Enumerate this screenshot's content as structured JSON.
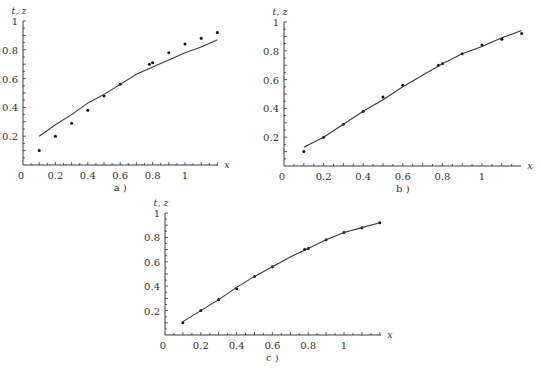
{
  "chart_data": [
    {
      "type": "line",
      "panel": "a",
      "caption": "a )",
      "xlabel": "x",
      "ylabel": "t, z",
      "xlim": [
        0,
        1.2
      ],
      "ylim": [
        0,
        1
      ],
      "xticks": [
        "0",
        "0.2",
        "0.4",
        "0.6",
        "0.8",
        "1"
      ],
      "yticks": [
        "0.2",
        "0.4",
        "0.6",
        "0.8",
        "1"
      ],
      "grid": false,
      "series": [
        {
          "name": "t (points)",
          "kind": "scatter",
          "x": [
            0.1,
            0.2,
            0.3,
            0.4,
            0.5,
            0.6,
            0.78,
            0.8,
            0.9,
            1.0,
            1.1,
            1.2
          ],
          "y": [
            0.1,
            0.2,
            0.29,
            0.38,
            0.48,
            0.56,
            0.7,
            0.71,
            0.78,
            0.84,
            0.88,
            0.92
          ]
        },
        {
          "name": "z (curve)",
          "kind": "line",
          "x": [
            0.1,
            0.2,
            0.3,
            0.4,
            0.5,
            0.6,
            0.7,
            0.8,
            0.9,
            1.0,
            1.1,
            1.2
          ],
          "y": [
            0.2,
            0.28,
            0.35,
            0.43,
            0.49,
            0.56,
            0.63,
            0.68,
            0.73,
            0.78,
            0.82,
            0.87
          ]
        }
      ]
    },
    {
      "type": "line",
      "panel": "b",
      "caption": "b )",
      "xlabel": "x",
      "ylabel": "t, z",
      "xlim": [
        0,
        1.2
      ],
      "ylim": [
        0,
        1
      ],
      "xticks": [
        "0",
        "0.2",
        "0.4",
        "0.6",
        "0.8",
        "1"
      ],
      "yticks": [
        "0.2",
        "0.4",
        "0.6",
        "0.8",
        "1"
      ],
      "grid": false,
      "series": [
        {
          "name": "t (points)",
          "kind": "scatter",
          "x": [
            0.1,
            0.2,
            0.3,
            0.4,
            0.5,
            0.6,
            0.78,
            0.8,
            0.9,
            1.0,
            1.1,
            1.2
          ],
          "y": [
            0.1,
            0.2,
            0.29,
            0.38,
            0.48,
            0.56,
            0.7,
            0.71,
            0.78,
            0.84,
            0.88,
            0.92
          ]
        },
        {
          "name": "z (curve)",
          "kind": "line",
          "x": [
            0.1,
            0.2,
            0.3,
            0.4,
            0.5,
            0.6,
            0.7,
            0.8,
            0.9,
            1.0,
            1.1,
            1.2
          ],
          "y": [
            0.13,
            0.2,
            0.29,
            0.38,
            0.46,
            0.55,
            0.63,
            0.71,
            0.78,
            0.83,
            0.89,
            0.94
          ]
        }
      ]
    },
    {
      "type": "line",
      "panel": "c",
      "caption": "c )",
      "xlabel": "x",
      "ylabel": "t, z",
      "xlim": [
        0,
        1.2
      ],
      "ylim": [
        0,
        1
      ],
      "xticks": [
        "0",
        "0.2",
        "0.4",
        "0.6",
        "0.8",
        "1"
      ],
      "yticks": [
        "0.2",
        "0.4",
        "0.6",
        "0.8",
        "1"
      ],
      "grid": false,
      "series": [
        {
          "name": "t (points)",
          "kind": "scatter",
          "x": [
            0.1,
            0.2,
            0.3,
            0.4,
            0.5,
            0.6,
            0.78,
            0.8,
            0.9,
            1.0,
            1.1,
            1.2
          ],
          "y": [
            0.1,
            0.2,
            0.29,
            0.38,
            0.48,
            0.56,
            0.7,
            0.71,
            0.78,
            0.84,
            0.88,
            0.92
          ]
        },
        {
          "name": "z (curve)",
          "kind": "line",
          "x": [
            0.1,
            0.2,
            0.3,
            0.4,
            0.5,
            0.6,
            0.7,
            0.8,
            0.9,
            1.0,
            1.1,
            1.2
          ],
          "y": [
            0.11,
            0.2,
            0.29,
            0.39,
            0.48,
            0.56,
            0.64,
            0.71,
            0.78,
            0.84,
            0.88,
            0.92
          ]
        }
      ]
    }
  ],
  "layout": [
    {
      "left": 0,
      "top": 0,
      "x0": 23,
      "x1": 185,
      "y0": 165,
      "y1": 21,
      "axisEnd": 218
    },
    {
      "left": 262,
      "top": 0,
      "x0": 22,
      "x1": 220,
      "y0": 166,
      "y1": 22,
      "axisEnd": 259
    },
    {
      "left": 140,
      "top": 195,
      "x0": 25,
      "x1": 204,
      "y0": 140,
      "y1": 18,
      "axisEnd": 241
    }
  ],
  "colors": {
    "ink": "#3a3a3a",
    "background": "#ffffff"
  }
}
